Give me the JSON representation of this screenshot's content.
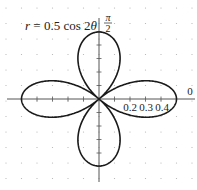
{
  "chart_data": {
    "type": "line",
    "subtype": "polar",
    "title": "r = 0.5 cos 2θ",
    "equation": {
      "lhs": "r",
      "eq": " = 0.5 cos 2",
      "var": "θ"
    },
    "series": [
      {
        "name": "r = 0.5 cos 2θ",
        "amplitude": 0.5,
        "k": 2,
        "theta_range": [
          0,
          6.2832
        ]
      }
    ],
    "radial_tick_labels": [
      "0.2",
      "0.3",
      "0.4"
    ],
    "radial_ticks": [
      0.1,
      0.2,
      0.3,
      0.4,
      0.5
    ],
    "angle_labels": {
      "zero": "0",
      "half_pi_num": "π",
      "half_pi_den": "2"
    },
    "rlim": [
      0,
      0.5
    ],
    "grid": "dotted",
    "legend": "none",
    "colors": {
      "curve": "#1a1a1a",
      "axis": "#555555",
      "grid": "#b0b0b0"
    }
  }
}
